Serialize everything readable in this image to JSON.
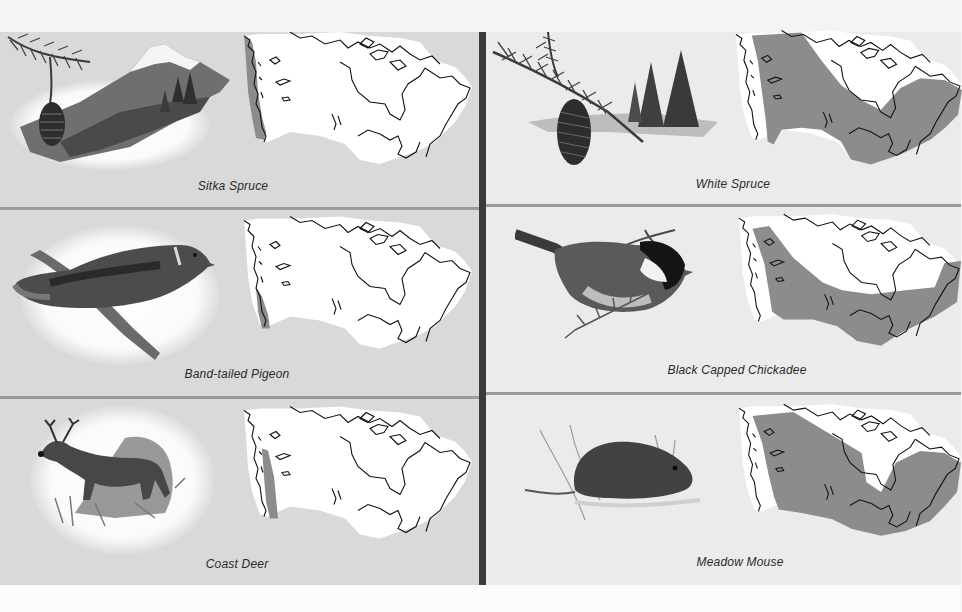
{
  "page": {
    "colors": {
      "left_background": "#d9d9d9",
      "right_background": "#ebebeb",
      "divider_dark": "#3b3b3b",
      "divider_light": "#9a9a9a",
      "range_fill": "#8c8c8c",
      "map_land": "#ffffff",
      "map_outline": "#111111"
    }
  },
  "panels": {
    "left": [
      {
        "caption": "Sitka Spruce",
        "illustration": "spruce-branch-mountain-icon",
        "range": "narrow Pacific coastal strip (British Columbia coast)"
      },
      {
        "caption": "Band-tailed Pigeon",
        "illustration": "pigeon-icon",
        "range": "southern British Columbia coast"
      },
      {
        "caption": "Coast Deer",
        "illustration": "deer-icon",
        "range": "British Columbia coastal strip"
      }
    ],
    "right": [
      {
        "caption": "White Spruce",
        "illustration": "spruce-cone-trees-icon",
        "range": "boreal belt from Yukon across to Labrador and Atlantic provinces"
      },
      {
        "caption": "Black Capped Chickadee",
        "illustration": "chickadee-icon",
        "range": "diagonal band from northern BC southeast to Atlantic coast"
      },
      {
        "caption": "Meadow Mouse",
        "illustration": "vole-icon",
        "range": "most of mainland Canada except far north and Hudson Bay"
      }
    ]
  }
}
